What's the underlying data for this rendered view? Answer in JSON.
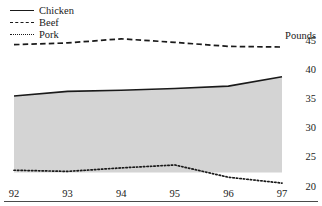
{
  "chart_data": {
    "type": "area",
    "title": "",
    "subtitle": "",
    "xlabel": "",
    "ylabel": "Pounds",
    "unit_caption": "Pounds",
    "x": [
      "92",
      "93",
      "94",
      "95",
      "96",
      "97"
    ],
    "categories": [
      "92",
      "93",
      "94",
      "95",
      "96",
      "97"
    ],
    "xtick_labels": [
      "92",
      "93",
      "94",
      "95",
      "96",
      "97"
    ],
    "ytick_labels": [
      "45",
      "40",
      "35",
      "30",
      "25",
      "20"
    ],
    "ytick_values": [
      45,
      40,
      35,
      30,
      25,
      20
    ],
    "ylim": [
      20,
      45
    ],
    "xlim": [
      "92",
      "97"
    ],
    "grid": false,
    "legend_position": "top-left",
    "series": [
      {
        "name": "Chicken",
        "style": "solid",
        "color": "#1a1a1a",
        "filled": true,
        "fill_color": "#d4d4d4",
        "values": [
          35.4,
          36.2,
          36.4,
          36.7,
          37.1,
          38.7
        ]
      },
      {
        "name": "Beef",
        "style": "dashed",
        "color": "#1a1a1a",
        "filled": false,
        "values": [
          44.2,
          44.5,
          45.2,
          44.6,
          43.9,
          43.8
        ]
      },
      {
        "name": "Pork",
        "style": "dotted",
        "color": "#1a1a1a",
        "filled": false,
        "values": [
          22.7,
          22.5,
          23.1,
          23.6,
          21.5,
          20.5
        ]
      }
    ],
    "legend": [
      {
        "label": "Chicken",
        "style": "solid"
      },
      {
        "label": "Beef",
        "style": "dashed"
      },
      {
        "label": "Pork",
        "style": "dotted"
      }
    ],
    "annotations": [
      {
        "type": "baseline",
        "value": 22.3,
        "note": "lower edge of shaded band"
      }
    ]
  },
  "legend": {
    "items": [
      {
        "label": "Chicken"
      },
      {
        "label": "Beef"
      },
      {
        "label": "Pork"
      }
    ]
  },
  "axes": {
    "unit_caption": "Pounds",
    "y_ticks": [
      "45",
      "40",
      "35",
      "30",
      "25",
      "20"
    ],
    "x_ticks": [
      "92",
      "93",
      "94",
      "95",
      "96",
      "97"
    ]
  },
  "colors": {
    "line": "#1a1a1a",
    "fill": "#d4d4d4",
    "rule": "#4a4a4a",
    "background": "#ffffff"
  }
}
